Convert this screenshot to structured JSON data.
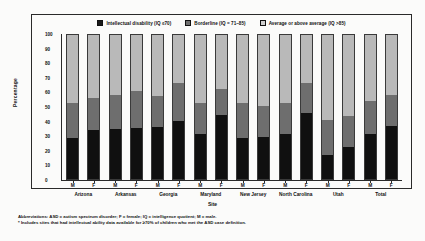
{
  "chart_data": {
    "type": "bar",
    "subtype": "stacked-percentage-column",
    "title": "",
    "xlabel": "Site",
    "ylabel": "Percentage",
    "ylim": [
      0,
      100
    ],
    "yticks": [
      0,
      10,
      20,
      30,
      40,
      50,
      60,
      70,
      80,
      90,
      100
    ],
    "grid": false,
    "legend_position": "top-center",
    "categories": [
      "Arizona M",
      "Arizona F",
      "Arkansas M",
      "Arkansas F",
      "Georgia M",
      "Georgia F",
      "Maryland M",
      "Maryland F",
      "New Jersey M",
      "New Jersey F",
      "North Carolina M",
      "North Carolina F",
      "Utah M",
      "Utah F",
      "Total M",
      "Total F"
    ],
    "sites": [
      "Arizona",
      "Arkansas",
      "Georgia",
      "Maryland",
      "New Jersey",
      "North Carolina",
      "Utah",
      "Total"
    ],
    "sex_ticks": [
      "M",
      "F"
    ],
    "series": [
      {
        "name": "Intellectual disability (IQ ≤70)",
        "color": "#101010",
        "values": [
          28.5,
          34.0,
          35.0,
          35.5,
          36.0,
          40.5,
          31.0,
          44.5,
          28.5,
          29.5,
          31.0,
          45.5,
          17.0,
          22.5,
          31.0,
          37.0
        ]
      },
      {
        "name": "Borderline (IQ = 71–85)",
        "color": "#6e6e6e",
        "values": [
          24.5,
          22.0,
          23.0,
          25.5,
          21.5,
          26.5,
          21.5,
          18.0,
          24.5,
          21.5,
          21.5,
          21.5,
          24.0,
          21.0,
          23.0,
          21.5
        ]
      },
      {
        "name": "Average or above average (IQ >85)",
        "color": "#b9b9b9",
        "values": [
          47.0,
          44.0,
          42.0,
          39.0,
          42.5,
          33.0,
          47.5,
          37.5,
          47.0,
          49.0,
          47.5,
          33.0,
          59.0,
          56.5,
          46.0,
          41.5
        ]
      }
    ]
  },
  "legend": {
    "items": [
      {
        "label": "Intellectual disability (IQ ≤70)",
        "swatch": "id"
      },
      {
        "label": "Borderline (IQ = 71–85)",
        "swatch": "bl"
      },
      {
        "label": "Average or above average (IQ >85)",
        "swatch": "av"
      }
    ]
  },
  "axes": {
    "y_title": "Percentage",
    "x_title": "Site",
    "y_tick_labels": [
      "100",
      "90",
      "80",
      "70",
      "60",
      "50",
      "40",
      "30",
      "20",
      "10",
      "0"
    ]
  },
  "footnotes": [
    "Abbreviations: ASD = autism spectrum disorder; F = female; IQ = intelligence quotient; M = male.",
    "* Includes sites that had intellectual ability data available for ≥70% of children who met the ASD case definition."
  ]
}
